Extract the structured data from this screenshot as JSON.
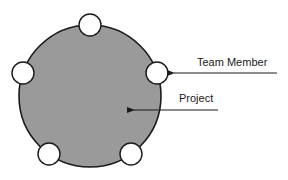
{
  "diagram": {
    "project": {
      "label": "Project",
      "fill": "#9a9a9a",
      "stroke": "#1a1a1a",
      "center": [
        90,
        96
      ],
      "radius": 71
    },
    "team_member": {
      "label": "Team Member",
      "count": 5,
      "fill": "#ffffff",
      "stroke": "#1a1a1a",
      "radius": 11
    }
  }
}
